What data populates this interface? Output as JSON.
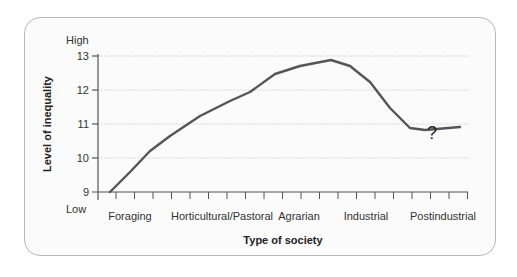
{
  "chart_data": {
    "type": "line",
    "title": "",
    "xlabel": "Type of society",
    "ylabel": "Level of inequality",
    "y_top_label": "High",
    "y_bottom_label": "Low",
    "ylim": [
      9,
      13
    ],
    "yticks": [
      9,
      10,
      11,
      12,
      13
    ],
    "categories": [
      "Foraging",
      "Horticultural/Pastoral",
      "Agrarian",
      "Industrial",
      "Postindustrial"
    ],
    "grid": true,
    "annotation": "?",
    "series": [
      {
        "name": "Inequality",
        "color": "#555555",
        "x": [
          0.0,
          0.5,
          1.0,
          1.5,
          2.0,
          2.5,
          2.85,
          3.15,
          3.5,
          3.85,
          4.2,
          4.4,
          4.85
        ],
        "values": [
          9.0,
          9.9,
          10.5,
          11.1,
          11.7,
          12.2,
          12.6,
          12.85,
          12.8,
          12.1,
          11.2,
          10.9,
          11.0
        ]
      }
    ],
    "colors": {
      "line": "#555555",
      "grid": "#d8d8d8",
      "axis": "#555555",
      "card_border": "#b8b8b8"
    }
  }
}
